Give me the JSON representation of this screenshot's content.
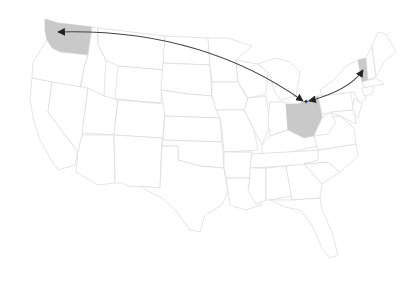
{
  "map": {
    "title": "United States",
    "highlight_color": "#c9c9c9",
    "border_color": "#d8d8d8",
    "arrow_color": "#444444",
    "highlighted_states": [
      "Washington",
      "Ohio",
      "Vermont"
    ],
    "origin": {
      "state": "Ohio",
      "marker": "star-icon",
      "x": 306,
      "y": 102
    },
    "arrows": [
      {
        "from": "Ohio",
        "to": "Washington",
        "type": "double-headed"
      },
      {
        "from": "Ohio",
        "to": "Vermont",
        "type": "double-headed"
      }
    ]
  }
}
